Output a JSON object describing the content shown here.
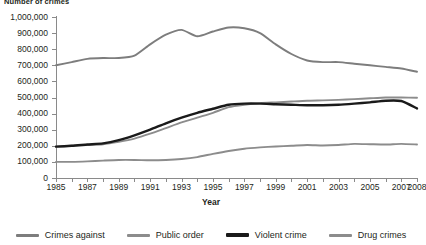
{
  "chart_data": {
    "type": "line",
    "title": "Number of crimes",
    "xlabel": "Year",
    "ylabel": "",
    "grid": false,
    "legend_position": "bottom",
    "x": [
      1985,
      1986,
      1987,
      1988,
      1989,
      1990,
      1991,
      1992,
      1993,
      1994,
      1995,
      1996,
      1997,
      1998,
      1999,
      2000,
      2001,
      2002,
      2003,
      2004,
      2005,
      2006,
      2007,
      2008
    ],
    "xtick_labels": [
      "1985",
      "1987",
      "1989",
      "1991",
      "1993",
      "1995",
      "1997",
      "1999",
      "2001",
      "2003",
      "2005",
      "2007",
      "2008"
    ],
    "xtick_values": [
      1985,
      1987,
      1989,
      1991,
      1993,
      1995,
      1997,
      1999,
      2001,
      2003,
      2005,
      2007,
      2008
    ],
    "ytick_labels": [
      "0",
      "100,000",
      "200,000",
      "300,000",
      "400,000",
      "500,000",
      "600,000",
      "700,000",
      "800,000",
      "900,000",
      "1,000,000"
    ],
    "ytick_values": [
      0,
      100000,
      200000,
      300000,
      400000,
      500000,
      600000,
      700000,
      800000,
      900000,
      1000000
    ],
    "ylim": [
      0,
      1000000
    ],
    "xlim": [
      1985,
      2008
    ],
    "series": [
      {
        "name": "Crimes against",
        "color": "#7d7d7d",
        "values": [
          700000,
          720000,
          740000,
          745000,
          745000,
          760000,
          830000,
          890000,
          920000,
          880000,
          910000,
          935000,
          930000,
          900000,
          830000,
          770000,
          730000,
          720000,
          720000,
          710000,
          700000,
          690000,
          680000,
          660000
        ]
      },
      {
        "name": "Public order",
        "color": "#8c8c8c",
        "values": [
          195000,
          200000,
          205000,
          210000,
          225000,
          245000,
          275000,
          310000,
          345000,
          375000,
          405000,
          440000,
          455000,
          465000,
          470000,
          475000,
          480000,
          482000,
          485000,
          490000,
          495000,
          500000,
          500000,
          498000
        ]
      },
      {
        "name": "Violent crime",
        "color": "#1a1a1a",
        "values": [
          195000,
          200000,
          208000,
          215000,
          235000,
          265000,
          300000,
          340000,
          375000,
          405000,
          430000,
          455000,
          462000,
          462000,
          458000,
          455000,
          452000,
          452000,
          455000,
          462000,
          470000,
          480000,
          478000,
          432000
        ]
      },
      {
        "name": "Drug crimes",
        "color": "#8c8c8c",
        "values": [
          100000,
          100000,
          103000,
          108000,
          112000,
          112000,
          110000,
          112000,
          118000,
          130000,
          150000,
          168000,
          182000,
          190000,
          196000,
          200000,
          205000,
          202000,
          205000,
          212000,
          210000,
          208000,
          212000,
          208000
        ]
      }
    ]
  },
  "legend": {
    "items": [
      {
        "label": "Crimes against"
      },
      {
        "label": "Public order"
      },
      {
        "label": "Violent crime"
      },
      {
        "label": "Drug crimes"
      }
    ]
  }
}
